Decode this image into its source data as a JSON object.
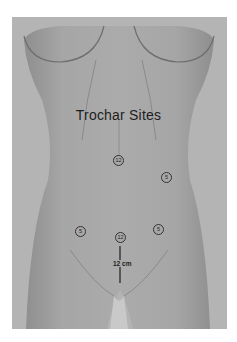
{
  "figure": {
    "title": "Trochar Sites",
    "measurement_label": "12 cm",
    "markers": [
      {
        "id": "upper-midline",
        "label": "12",
        "x": 118,
        "y": 160
      },
      {
        "id": "right-upper-quadrant",
        "label": "5",
        "x": 166,
        "y": 177
      },
      {
        "id": "left-lower-quadrant",
        "label": "5",
        "x": 80,
        "y": 231
      },
      {
        "id": "lower-midline",
        "label": "12",
        "x": 120,
        "y": 237
      },
      {
        "id": "right-lower-quadrant",
        "label": "5",
        "x": 158,
        "y": 229
      }
    ],
    "colors": {
      "background": "#b4b4b4",
      "body": "#a3a3a3",
      "text": "#1e1e1e"
    }
  }
}
